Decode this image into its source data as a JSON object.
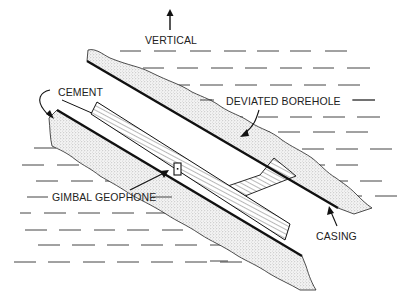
{
  "diagram": {
    "type": "borehole-cross-section",
    "labels": {
      "vertical": "VERTICAL",
      "cement": "CEMENT",
      "deviated_borehole": "DEVIATED BOREHOLE",
      "gimbal_geophone": "GIMBAL GEOPHONE",
      "casing": "CASING"
    },
    "colors": {
      "ink": "#111111",
      "background": "#ffffff",
      "stipple": "#9a9a9a"
    }
  }
}
